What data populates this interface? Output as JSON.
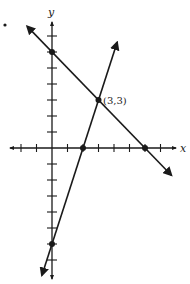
{
  "chart_data": {
    "type": "line",
    "title": "",
    "xlabel": "x",
    "ylabel": "y",
    "xlim": [
      -2.7,
      7.9
    ],
    "ylim": [
      -8.1,
      7.8
    ],
    "grid": false,
    "x_ticks": [
      -2,
      -1,
      1,
      2,
      3,
      4,
      5,
      6,
      7
    ],
    "y_ticks": [
      7,
      6,
      5,
      4,
      3,
      2,
      1,
      -1,
      -2,
      -3,
      -4,
      -5,
      -6,
      -7
    ],
    "series": [
      {
        "name": "line-decreasing",
        "equation": "y = -x + 6",
        "slope": -1,
        "intercept": 6,
        "x_range": [
          -1.6,
          7.7
        ],
        "points": [
          [
            0,
            6
          ],
          [
            3,
            3
          ],
          [
            6,
            0
          ]
        ]
      },
      {
        "name": "line-increasing",
        "equation": "y = 3x - 6",
        "slope": 3,
        "intercept": -6,
        "x_range": [
          -0.65,
          4.2
        ],
        "points": [
          [
            2,
            0
          ],
          [
            3,
            3
          ],
          [
            0,
            -6
          ]
        ]
      }
    ],
    "marked_points": [
      [
        0,
        6
      ],
      [
        3,
        3
      ],
      [
        2,
        0
      ],
      [
        6,
        0
      ],
      [
        0,
        -6
      ]
    ],
    "annotations": [
      {
        "text": "(3,3)",
        "at": [
          3,
          3
        ]
      }
    ]
  },
  "labels": {
    "x_axis": "x",
    "y_axis": "y",
    "intersection": "(3,3)"
  },
  "layout": {
    "origin_px": [
      52,
      148
    ],
    "unit_x_px": 15.5,
    "unit_y_px": 16,
    "x_axis_px": [
      10,
      176
    ],
    "y_axis_px": [
      22,
      279
    ],
    "stray_dot_px": [
      5,
      25
    ],
    "color": "#1a1a1a"
  }
}
